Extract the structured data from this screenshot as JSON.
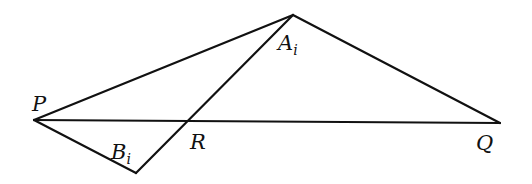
{
  "diagram": {
    "type": "geometry",
    "points": {
      "P": {
        "x": 34,
        "y": 120
      },
      "Q": {
        "x": 500,
        "y": 123
      },
      "A": {
        "x": 293,
        "y": 15
      },
      "B": {
        "x": 136,
        "y": 173
      },
      "R": {
        "x": 188,
        "y": 121
      }
    },
    "segments": [
      {
        "from": "P",
        "to": "A"
      },
      {
        "from": "A",
        "to": "Q"
      },
      {
        "from": "P",
        "to": "Q"
      },
      {
        "from": "P",
        "to": "B"
      },
      {
        "from": "B",
        "to": "A"
      }
    ],
    "labels": {
      "P": {
        "base": "P",
        "sub": ""
      },
      "A": {
        "base": "A",
        "sub": "i"
      },
      "B": {
        "base": "B",
        "sub": "i"
      },
      "R": {
        "base": "R",
        "sub": ""
      },
      "Q": {
        "base": "Q",
        "sub": ""
      }
    },
    "stroke_color": "#111111",
    "background": "#ffffff"
  }
}
